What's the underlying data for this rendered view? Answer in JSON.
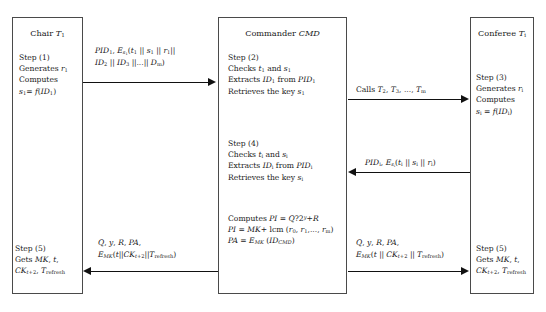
{
  "diagram": {
    "type": "protocol-sequence-diagram",
    "parties": [
      {
        "id": "chair",
        "title": "Chair T₁"
      },
      {
        "id": "commander",
        "title": "Commander CMD"
      },
      {
        "id": "conferee",
        "title": "Conferee Tᵢ"
      }
    ]
  },
  "chair": {
    "step1": {
      "label": "Step (1)",
      "lines": [
        "Step (1)",
        "Generates r₁",
        "Computes",
        "s₁ = f(ID₁)"
      ]
    },
    "step5": {
      "label": "Step (5)",
      "lines": [
        "Step (5)",
        "Gets MK, t,",
        "CKₜ₊₂, T_refresh"
      ]
    }
  },
  "commander": {
    "step2": {
      "label": "Step (2)",
      "lines": [
        "Step (2)",
        "Checks t₁ and s₁",
        "Extracts ID₁ from PID₁",
        "Retrieves the key s₁"
      ]
    },
    "step4": {
      "label": "Step (4)",
      "lines": [
        "Step (4)",
        "Checks tᵢ and sᵢ",
        "Extracts IDᵢ from PIDᵢ",
        "Retrieves the key sᵢ"
      ]
    },
    "computations": {
      "lines": [
        "Computes PI = Q?2^y + R",
        "PI = MK + lcm (r₀, r₁,..., rₘ)",
        "PA = E_MK (ID_CMD)"
      ]
    }
  },
  "conferee": {
    "step3": {
      "label": "Step (3)",
      "lines": [
        "Step (3)",
        "Generates rᵢ",
        "Computes",
        "sᵢ = f(IDᵢ)"
      ]
    },
    "step5": {
      "label": "Step (5)",
      "lines": [
        "Step (5)",
        "Gets MK, t,",
        "CKₜ₊₂, T_refresh"
      ]
    }
  },
  "messages": [
    {
      "id": "msg1",
      "from": "chair",
      "to": "commander",
      "direction": "right",
      "lines": [
        "PID₁, E_s₁(t₁ || s₁ || r₁||",
        "ID₂ || ID₃ ||...|| Dₘ)"
      ]
    },
    {
      "id": "msg2",
      "from": "commander",
      "to": "conferee",
      "direction": "right",
      "lines": [
        "Calls T₂, T₃, ..., Tₘ"
      ]
    },
    {
      "id": "msg3",
      "from": "conferee",
      "to": "commander",
      "direction": "left",
      "lines": [
        "PIDᵢ, E_sᵢ(tᵢ || sᵢ || rᵢ)"
      ]
    },
    {
      "id": "msg4",
      "from": "commander",
      "to": "chair",
      "direction": "left",
      "lines": [
        "Q, y, R, PA,",
        "E_MK(t||CKₜ₊₂||T_refresh)"
      ]
    },
    {
      "id": "msg5",
      "from": "commander",
      "to": "conferee",
      "direction": "right",
      "lines": [
        "Q, y, R, PA,",
        "E_MK(t || CKₜ₊₂ || T_refresh)"
      ]
    }
  ],
  "colors": {
    "box_border": "#4a4a4a",
    "arrow": "#111111",
    "text": "#1a1a1a",
    "background": "#ffffff"
  }
}
